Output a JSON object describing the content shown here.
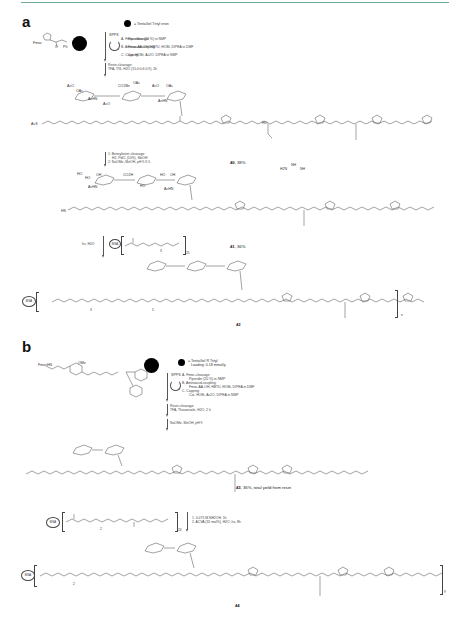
{
  "figure": {
    "panels": [
      {
        "label": "a",
        "legend": "= TentaGel Trityl resin",
        "start_material": {
          "protecting_group": "Fmoc",
          "substituents": [
            "Ph",
            "Ph",
            "O"
          ]
        },
        "spps": {
          "title": "SPPS",
          "steps": [
            {
              "id": "A",
              "name": "Fmoc-cleavage:",
              "conditions": "Piperidine (20 %) in NMP"
            },
            {
              "id": "B",
              "name": "Aminoacid-coupling:",
              "conditions": "Fmoc-AA-OH, HBTU, HOBt, DIPEA in DMF"
            },
            {
              "id": "C",
              "name": "Capping:",
              "conditions": "Cat. HOBt, Ac2O, DIPEA in NMP"
            }
          ]
        },
        "resin_cleavage": {
          "name": "Resin-cleavage:",
          "conditions": "TFA, TIS, H2O (15.0:0.6:0.9), 2h"
        },
        "compound_40": {
          "id": "40",
          "yield": "38%",
          "linker_start": "AcS",
          "sugar_groups": [
            "AcO",
            "OAc",
            "CO2Bn",
            "AcHN",
            "AcO",
            "OAc",
            "AcO",
            "OAc",
            "AcHN"
          ],
          "labels": [
            "OH",
            "HO",
            "HO",
            "OH",
            "NH",
            "H2N",
            "NH"
          ]
        },
        "step_2": {
          "steps": [
            {
              "id": "1",
              "text": "Benzylester-cleavage:",
              "conditions": "H2, Pd/C (10%), MeOH"
            },
            {
              "id": "2",
              "text": "NaOMe, MeOH, pH 9-9.5"
            }
          ]
        },
        "compound_41": {
          "id": "41",
          "yield": "36%",
          "linker_start": "HS",
          "sugar_groups": [
            "HO",
            "HO",
            "OH",
            "AcHN",
            "HO",
            "CO2H",
            "OH",
            "OH",
            "HO",
            "HO",
            "OH",
            "AcHN"
          ]
        },
        "step_3": {
          "conditions": "hν, H2O",
          "carrier": "BSA",
          "repeat": "25",
          "peg_repeat": "3"
        },
        "compound_42": {
          "id": "42",
          "repeat": "n",
          "carrier": "BSA",
          "peg_repeat_1": "3",
          "peg_repeat_2": "5"
        }
      },
      {
        "label": "b",
        "legend": {
          "line1": "= TentaGel R Trityl",
          "line2": "Loading: 0.18 mmol/g"
        },
        "start_material": {
          "protecting_group": "FmocHN",
          "substituents": [
            "OMe",
            "O",
            "N",
            "H"
          ]
        },
        "spps": {
          "title": "SPPS",
          "steps": [
            {
              "id": "A",
              "name": "Fmoc-cleavage:",
              "conditions": "Piperidin (20 %) in NMP"
            },
            {
              "id": "B",
              "name": "Aminoacid-coupling:",
              "conditions": "Fmoc-AA-OH, HBTU, HOBt, DIPEA in DMF"
            },
            {
              "id": "C",
              "name": "Capping:",
              "conditions": "Cat. HOBt, Ac2O, DIPEA in NMP"
            }
          ]
        },
        "resin_cleavage": {
          "name": "Resin-cleavage:",
          "conditions": "TFA, Thioanisole, H2O, 2 h"
        },
        "deprotection": "NaOMe, MeOH, pH 9",
        "compound_43": {
          "id": "43",
          "yield": "36%, total yield from resin"
        },
        "step_4": {
          "carrier": "BSA",
          "repeat": "24",
          "peg_repeat": "2",
          "steps": [
            {
              "id": "1",
              "text": "0.075 M NH2OH, 1h"
            },
            {
              "id": "2",
              "text": "ACVA (31 mol%), H2O, hν, 8h"
            }
          ]
        },
        "compound_44": {
          "id": "44",
          "repeat": "9",
          "carrier": "BSA",
          "peg_repeat": "2"
        }
      }
    ],
    "colors": {
      "rule": "#6fa99a",
      "ink": "#333333",
      "resin": "#000000"
    }
  }
}
